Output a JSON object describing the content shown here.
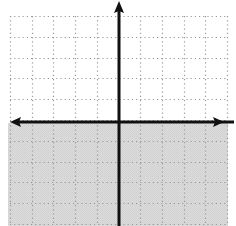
{
  "diagram": {
    "type": "coordinate-plane",
    "grid": {
      "cells_x": 10,
      "cells_y": 10,
      "x_min": -5,
      "x_max": 5,
      "y_min": -5,
      "y_max": 5,
      "style": "dotted",
      "color": "#9a9a9a"
    },
    "axes": {
      "x_axis": {
        "arrows": "both",
        "color": "#111111"
      },
      "y_axis": {
        "arrows": "positive-only",
        "color": "#111111"
      }
    },
    "shaded_region": {
      "inequality": "y < 0",
      "region": "below x-axis",
      "color": "#d9d9d9"
    }
  }
}
